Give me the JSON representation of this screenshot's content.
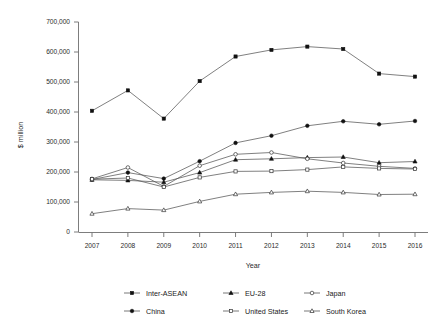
{
  "chart_data": {
    "type": "line",
    "title": "",
    "xlabel": "Year",
    "ylabel": "$ million",
    "categories": [
      "2007",
      "2008",
      "2009",
      "2010",
      "2011",
      "2012",
      "2013",
      "2014",
      "2015",
      "2016"
    ],
    "x": [
      2007,
      2008,
      2009,
      2010,
      2011,
      2012,
      2013,
      2014,
      2015,
      2016
    ],
    "xlim": [
      2007,
      2016
    ],
    "ylim": [
      0,
      700000
    ],
    "ytick_values": [
      0,
      100000,
      200000,
      300000,
      400000,
      500000,
      600000,
      700000
    ],
    "ytick_labels": [
      "0",
      "100,000",
      "200,000",
      "300,000",
      "400,000",
      "500,000",
      "600,000",
      "700,000"
    ],
    "grid": false,
    "legend_position": "bottom",
    "series": [
      {
        "name": "Inter-ASEAN",
        "marker": "filled-square",
        "values": [
          404000,
          472000,
          378000,
          503000,
          585000,
          607000,
          618000,
          610000,
          528000,
          518000
        ]
      },
      {
        "name": "EU-28",
        "marker": "filled-triangle",
        "values": [
          174000,
          172000,
          166000,
          198000,
          241000,
          244000,
          248000,
          250000,
          231000,
          235000
        ]
      },
      {
        "name": "Japan",
        "marker": "open-circle",
        "values": [
          177000,
          215000,
          152000,
          221000,
          259000,
          265000,
          244000,
          230000,
          219000,
          212000
        ]
      },
      {
        "name": "China",
        "marker": "filled-circle",
        "values": [
          175000,
          198000,
          178000,
          236000,
          297000,
          321000,
          354000,
          369000,
          359000,
          370000
        ]
      },
      {
        "name": "United States",
        "marker": "open-square",
        "values": [
          176000,
          180000,
          150000,
          182000,
          202000,
          203000,
          208000,
          217000,
          212000,
          210000
        ]
      },
      {
        "name": "South Korea",
        "marker": "open-triangle",
        "values": [
          61000,
          78000,
          73000,
          102000,
          126000,
          132000,
          136000,
          132000,
          125000,
          126000
        ]
      }
    ]
  },
  "legend": {
    "items": [
      {
        "label": "Inter-ASEAN"
      },
      {
        "label": "EU-28"
      },
      {
        "label": "Japan"
      },
      {
        "label": "China"
      },
      {
        "label": "United States"
      },
      {
        "label": "South Korea"
      }
    ]
  },
  "colors": {
    "line": "#555555",
    "marker_fill": "#111111",
    "marker_open": "#ffffff",
    "axis": "#6e6e6e",
    "text": "#1a1a1a",
    "background": "#ffffff"
  }
}
